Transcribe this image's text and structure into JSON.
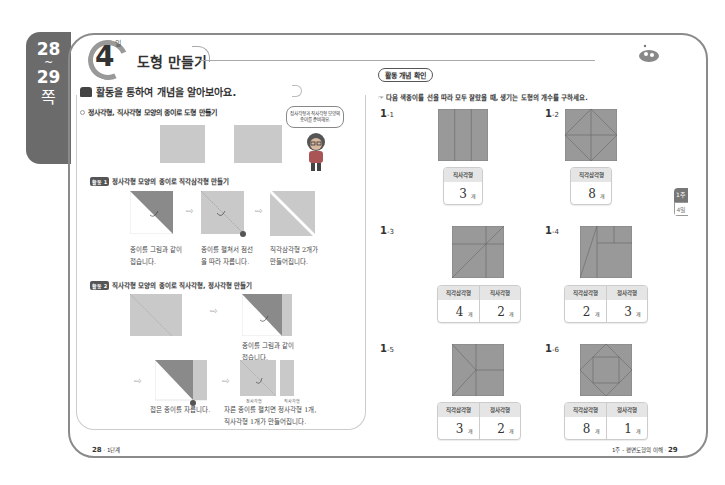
{
  "page_tab": {
    "start": "28",
    "tilde": "~",
    "end": "29",
    "suffix": "쪽"
  },
  "header": {
    "day_number": "4",
    "day_label": "일",
    "title": "도형 만들기"
  },
  "left": {
    "activity_title": "활동을 통하여 개념을 알아보아요.",
    "section_title": "정사각형, 직사각형 모양의 종이로 도형 만들기",
    "speech_bubble": "정사각형과 직사각형 모양의 종이를 준비해요.",
    "activity1": {
      "tag": "활동 1",
      "title": "정사각형 모양의 종이로 직각삼각형 만들기",
      "captions": [
        "종이를 그림과 같이 접습니다.",
        "종이를 펼쳐서 점선을 따라 자릅니다.",
        "직각삼각형 2개가 만들어집니다."
      ]
    },
    "activity2": {
      "tag": "활동 2",
      "title": "직사각형 모양의 종이로 직사각형, 정사각형 만들기",
      "captions": [
        "종이를 그림과 같이 접습니다.",
        "접은 종이를 자릅니다.",
        "자른 종이를 펼치면 정사각형 1개, 직사각형 1개가 만들어집니다."
      ],
      "labels": [
        "정사각형",
        "직사각형"
      ]
    },
    "footer": {
      "page": "28",
      "sep": "·",
      "label": "1단계"
    }
  },
  "right": {
    "badge": "활동 개념 확인",
    "question": "다음 색종이를 선을 따라 모두 잘랐을 때, 생기는 도형의 개수를 구하세요.",
    "unit": "개",
    "problems": [
      {
        "id": "1",
        "sub": "-1",
        "headers": [
          "직사각형"
        ],
        "values": [
          "3"
        ]
      },
      {
        "id": "1",
        "sub": "-2",
        "headers": [
          "직각삼각형"
        ],
        "values": [
          "8"
        ]
      },
      {
        "id": "1",
        "sub": "-3",
        "headers": [
          "직각삼각형",
          "직사각형"
        ],
        "values": [
          "4",
          "2"
        ]
      },
      {
        "id": "1",
        "sub": "-4",
        "headers": [
          "직각삼각형",
          "정사각형"
        ],
        "values": [
          "2",
          "3"
        ]
      },
      {
        "id": "1",
        "sub": "-5",
        "headers": [
          "직각삼각형",
          "정사각형"
        ],
        "values": [
          "3",
          "2"
        ]
      },
      {
        "id": "1",
        "sub": "-6",
        "headers": [
          "직각삼각형",
          "정사각형"
        ],
        "values": [
          "8",
          "1"
        ]
      }
    ],
    "side_tab": {
      "week": "1주",
      "day": "4일"
    },
    "footer": {
      "label": "1주 - 평면도형의 이해",
      "sep": "·",
      "page": "29"
    }
  }
}
